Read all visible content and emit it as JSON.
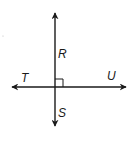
{
  "figure": {
    "colors": {
      "line": "#1a1a1a",
      "background": "#ffffff"
    },
    "labels": {
      "R": "R",
      "S": "S",
      "T": "T",
      "U": "U"
    },
    "vertical_line": {
      "top_label": "R",
      "bottom_label": "S"
    },
    "horizontal_line": {
      "left_label": "T",
      "right_label": "U"
    },
    "right_angle_marker": true
  }
}
